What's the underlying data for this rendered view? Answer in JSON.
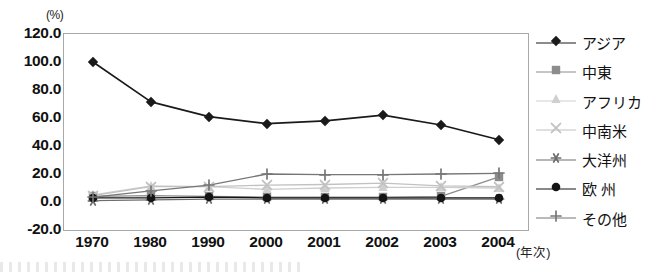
{
  "chart_data": {
    "type": "line",
    "title": "",
    "xlabel": "(年次)",
    "ylabel": "(%)",
    "unit_label": "(%)",
    "categories": [
      "1970",
      "1980",
      "1990",
      "2000",
      "2001",
      "2002",
      "2003",
      "2004"
    ],
    "ylim": [
      -20.0,
      120.0
    ],
    "ytick_labels": [
      "120.0",
      "100.0",
      "80.0",
      "60.0",
      "40.0",
      "20.0",
      "0.0",
      "-20.0"
    ],
    "ytick_values": [
      120.0,
      100.0,
      80.0,
      60.0,
      40.0,
      20.0,
      0.0,
      -20.0
    ],
    "grid": false,
    "legend_position": "right",
    "series": [
      {
        "name": "アジア",
        "marker": "diamond",
        "color": "#1a1a1a",
        "values": [
          100.0,
          71.5,
          61.0,
          56.0,
          58.0,
          62.0,
          55.0,
          44.5
        ]
      },
      {
        "name": "中東",
        "marker": "square",
        "color": "#8c8c8c",
        "values": [
          4.0,
          4.5,
          4.0,
          3.5,
          3.5,
          3.5,
          4.0,
          18.0
        ]
      },
      {
        "name": "アフリカ",
        "marker": "triangle",
        "color": "#cfcfcf",
        "values": [
          5.0,
          11.5,
          11.0,
          9.0,
          10.0,
          10.5,
          10.5,
          10.0
        ]
      },
      {
        "name": "中南米",
        "marker": "x",
        "color": "#c2c2c2",
        "values": [
          4.5,
          11.0,
          11.0,
          12.0,
          12.5,
          13.5,
          11.5,
          11.0
        ]
      },
      {
        "name": "大洋州",
        "marker": "asterisk",
        "color": "#6e6e6e",
        "values": [
          1.0,
          1.5,
          2.0,
          2.0,
          2.0,
          2.0,
          2.0,
          2.0
        ]
      },
      {
        "name": "欧 州",
        "marker": "circle",
        "color": "#141414",
        "values": [
          3.0,
          3.0,
          3.5,
          3.0,
          3.0,
          3.0,
          3.0,
          3.0
        ]
      },
      {
        "name": "その他",
        "marker": "plus",
        "color": "#767676",
        "values": [
          3.5,
          8.0,
          12.0,
          20.0,
          19.5,
          19.5,
          20.0,
          20.5
        ]
      }
    ]
  }
}
